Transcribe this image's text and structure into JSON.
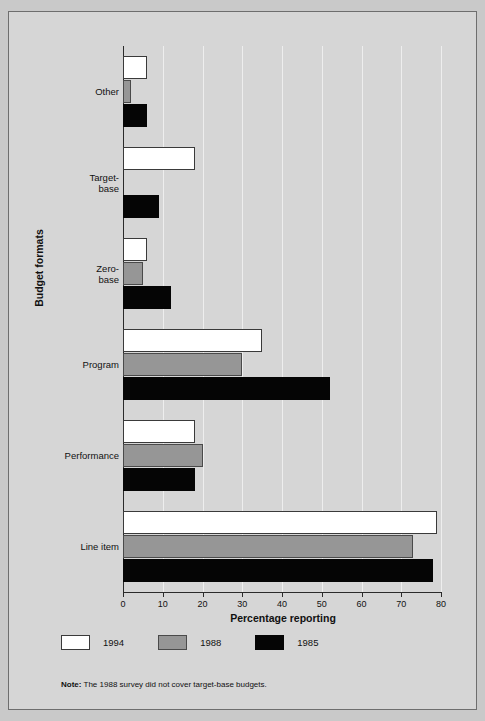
{
  "chart_data": {
    "type": "bar",
    "orientation": "horizontal",
    "title": "",
    "xlabel": "Percentage reporting",
    "ylabel": "Budget formats",
    "xlim": [
      0,
      80
    ],
    "xticks": [
      0,
      10,
      20,
      30,
      40,
      50,
      60,
      70,
      80
    ],
    "grid": true,
    "legend_position": "bottom-left",
    "categories": [
      "Other",
      "Target-base",
      "Zero-base",
      "Program",
      "Performance",
      "Line item"
    ],
    "category_lines": [
      [
        "Other"
      ],
      [
        "Target-",
        "base"
      ],
      [
        "Zero-",
        "base"
      ],
      [
        "Program"
      ],
      [
        "Performance"
      ],
      [
        "Line item"
      ]
    ],
    "series": [
      {
        "name": "1994",
        "color": "#ffffff",
        "values": [
          6,
          18,
          6,
          35,
          18,
          79
        ]
      },
      {
        "name": "1988",
        "color": "#969696",
        "values": [
          2,
          null,
          5,
          30,
          20,
          73
        ]
      },
      {
        "name": "1985",
        "color": "#050505",
        "values": [
          6,
          9,
          12,
          52,
          18,
          78
        ]
      }
    ],
    "note_bold": "Note:",
    "note_text": " The 1988 survey did not cover target-base budgets."
  },
  "colors": {
    "page_background": "#c9c9c9",
    "figure_background": "#d6d6d6",
    "axis": "#2a2a2a",
    "gridline": "#eeeeee",
    "text": "#111111"
  }
}
